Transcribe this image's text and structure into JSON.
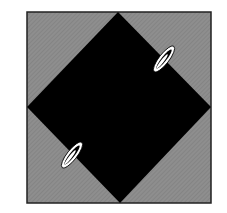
{
  "figure": {
    "colors": {
      "background": "#ffffff",
      "square_fill": "#8a8a8a",
      "square_border": "#222222",
      "diamond_fill": "#000000",
      "ellipse_fill": "#ffffff"
    },
    "square": {
      "x": 27,
      "y": 12,
      "width": 184,
      "height": 191
    },
    "diamond": {
      "top": [
        118,
        12
      ],
      "right": [
        211,
        107
      ],
      "bottom": [
        120,
        203
      ],
      "left": [
        27,
        107
      ]
    },
    "markers": [
      {
        "name": "upper-right-marker",
        "cx": 164,
        "cy": 59,
        "rx": 17,
        "ry": 5,
        "rotate": -52
      },
      {
        "name": "lower-left-marker",
        "cx": 72,
        "cy": 155,
        "rx": 17,
        "ry": 5,
        "rotate": -52
      }
    ]
  }
}
